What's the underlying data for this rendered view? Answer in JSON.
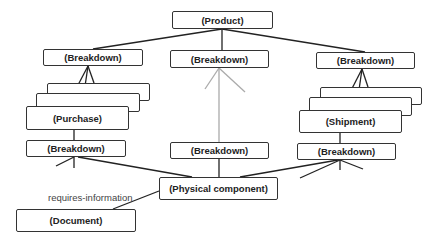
{
  "diagram": {
    "nodes": {
      "product": "(Product)",
      "breakdown_left": "(Breakdown)",
      "breakdown_middle": "(Breakdown)",
      "breakdown_right": "(Breakdown)",
      "purchase": "(Purchase)",
      "shipment": "(Shipment)",
      "breakdown_left_lower": "(Breakdown)",
      "breakdown_middle_lower": "(Breakdown)",
      "breakdown_right_lower": "(Breakdown)",
      "physical_component": "(Physical component)",
      "document": "(Document)"
    },
    "edge_labels": {
      "requires_information": "requires-information"
    },
    "colors": {
      "line": "#222222",
      "gray_line": "#aaaaaa",
      "border": "#333333"
    }
  }
}
